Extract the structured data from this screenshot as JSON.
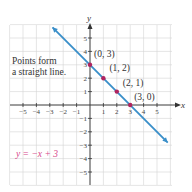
{
  "chart_data": {
    "type": "line",
    "title": "",
    "xlabel": "x",
    "ylabel": "y",
    "xlim": [
      -6,
      6
    ],
    "ylim": [
      -6,
      6
    ],
    "grid": true,
    "x_ticks": [
      -5,
      -4,
      -3,
      -2,
      -1,
      1,
      2,
      3,
      4,
      5
    ],
    "y_ticks": [
      -5,
      -4,
      -3,
      -2,
      -1,
      1,
      2,
      3,
      4,
      5
    ],
    "series": [
      {
        "name": "y = -x + 3",
        "equation": "y = −x + 3",
        "slope": -1,
        "intercept": 3,
        "line_x_range": [
          -2.8,
          5.8
        ],
        "color": "#3a8fc9",
        "arrows": "both"
      }
    ],
    "points": [
      {
        "x": 0,
        "y": 3,
        "label": "(0, 3)"
      },
      {
        "x": 1,
        "y": 2,
        "label": "(1, 2)"
      },
      {
        "x": 2,
        "y": 1,
        "label": "(2, 1)"
      },
      {
        "x": 3,
        "y": 0,
        "label": "(3, 0)"
      }
    ],
    "point_color": "#b0245f",
    "annotations": [
      {
        "text_lines": [
          "Points form",
          "a straight line."
        ],
        "position": "upper-left"
      },
      {
        "text": "y = −x + 3",
        "position": "lower-left",
        "color": "#d6478a"
      }
    ]
  }
}
